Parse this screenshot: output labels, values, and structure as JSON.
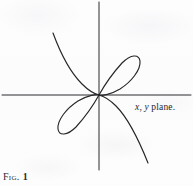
{
  "figure": {
    "caption_label": "Fig.",
    "caption_number": "1",
    "axis_label_x_var": "x",
    "axis_label_comma": ", ",
    "axis_label_y_var": "y",
    "axis_label_suffix": " plane.",
    "axis_label_full": "x, y plane.",
    "ink_color": "#262629",
    "paper_color": "#fdfdfd"
  },
  "chart_data": {
    "type": "line",
    "title": "",
    "subtitle": "",
    "xlabel": "x",
    "ylabel": "y",
    "annotations": [
      {
        "text": "x, y plane.",
        "x_px": 135,
        "y_px": 103
      },
      {
        "text": "Fig. 1",
        "x_px": 3,
        "y_px": 172
      }
    ],
    "grid": false,
    "legend": null,
    "axes": {
      "origin_px": {
        "x": 99,
        "y": 95
      },
      "x_axis_px": {
        "x1": 2,
        "y1": 95,
        "x2": 191,
        "y2": 95
      },
      "y_axis_px": {
        "x1": 99,
        "y1": 2,
        "x2": 99,
        "y2": 170
      }
    },
    "series": [
      {
        "name": "upper-right loop",
        "description": "closed tilted oval loop from origin into quadrant I",
        "path_px": "M 99 95 C 104 86 112 74 122 63 C 131 54 139 54 140 61 C 141 70 131 82 120 89 C 110 95 101 96 99 95 Z"
      },
      {
        "name": "lower-left loop",
        "description": "closed tilted oval loop from origin into quadrant III",
        "path_px": "M 99 95 C 94 104 86 116 76 127 C 67 136 59 136 58 129 C 57 120 67 108 78 101 C 88 95 97 94 99 95 Z"
      },
      {
        "name": "upper-left branch",
        "description": "asymptotic branch from quadrant II descending into the origin",
        "path_px": "M 53 33 C 60 52 70 72 82 84 C 89 91 95 94 99 95"
      },
      {
        "name": "lower-right branch",
        "description": "asymptotic branch from the origin descending into quadrant IV",
        "path_px": "M 99 95 C 103 96 109 99 116 106 C 128 118 140 143 148 163"
      }
    ]
  }
}
